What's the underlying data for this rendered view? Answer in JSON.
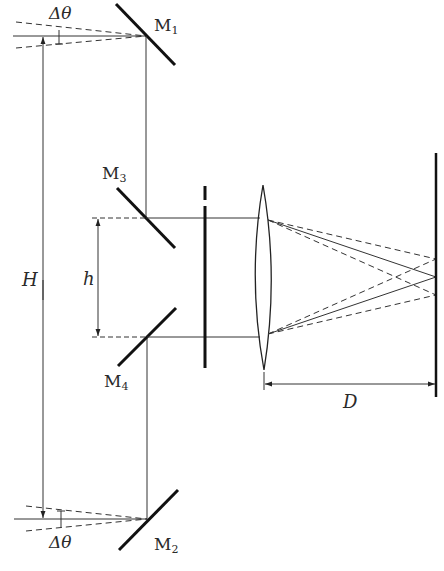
{
  "diagram": {
    "type": "optical-schematic",
    "title": "",
    "colors": {
      "line": "#222222",
      "background": "#ffffff"
    },
    "labels": {
      "delta_theta_top": "Δθ",
      "delta_theta_bottom": "Δθ",
      "H": "H",
      "h": "h",
      "D": "D",
      "M1": {
        "base": "M",
        "sub": "1"
      },
      "M2": {
        "base": "M",
        "sub": "2"
      },
      "M3": {
        "base": "M",
        "sub": "3"
      },
      "M4": {
        "base": "M",
        "sub": "4"
      }
    },
    "components": [
      {
        "id": "M1",
        "kind": "mirror",
        "position": "top"
      },
      {
        "id": "M2",
        "kind": "mirror",
        "position": "bottom"
      },
      {
        "id": "M3",
        "kind": "mirror",
        "position": "upper-middle"
      },
      {
        "id": "M4",
        "kind": "mirror",
        "position": "lower-middle"
      },
      {
        "id": "aperture",
        "kind": "slit-screen"
      },
      {
        "id": "lens",
        "kind": "converging-lens"
      },
      {
        "id": "screen",
        "kind": "observation-screen"
      }
    ],
    "dimensions": [
      {
        "label": "H",
        "meaning": "separation between M1 and M2"
      },
      {
        "label": "h",
        "meaning": "separation between M3 and M4 beams"
      },
      {
        "label": "D",
        "meaning": "lens to screen distance"
      },
      {
        "label": "Δθ",
        "meaning": "angular spread of incoming rays"
      }
    ]
  }
}
